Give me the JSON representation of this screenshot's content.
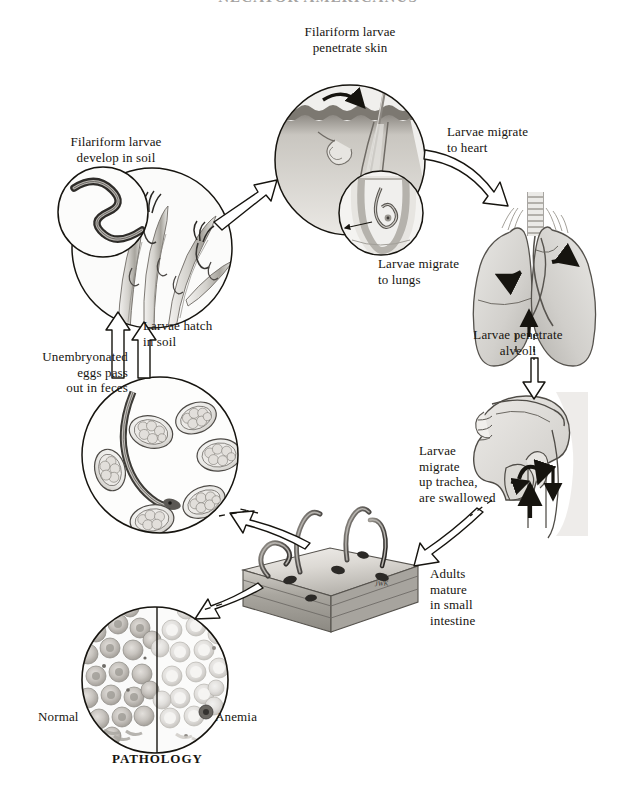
{
  "title": "NECATOR AMERICANUS",
  "figure": {
    "kind": "life-cycle-diagram",
    "background_color": "#ffffff",
    "ink_color": "#16140f",
    "signature": "JWK"
  },
  "stages": [
    {
      "id": "penetrate-skin",
      "label": "Filariform larvae\npenetrate skin",
      "art": "skin-section-with-hair-follicle-and-larva"
    },
    {
      "id": "develop-in-soil",
      "label": "Filariform larvae\ndevelop in soil",
      "art": "coiled-filariform-larva-inset"
    },
    {
      "id": "hatch-in-soil",
      "label": "Larvae hatch\nin soil",
      "art": "grass-blades-with-larvae"
    },
    {
      "id": "eggs-in-feces",
      "label": "Unembryonated\neggs pass\nout in feces",
      "art": "fecal-smear-with-eggs-and-larva"
    },
    {
      "id": "migrate-to-heart",
      "label": "Larvae migrate\nto heart",
      "art": "arrow-only"
    },
    {
      "id": "migrate-to-lungs",
      "label": "Larvae migrate\nto lungs",
      "art": "lungs-with-trachea"
    },
    {
      "id": "penetrate-alveoli",
      "label": "Larvae penetrate\nalveoli",
      "art": "upward-arrow-into-lungs"
    },
    {
      "id": "migrate-up-trachea",
      "label": "Larvae\nmigrate\nup trachea,\nare swallowed",
      "art": "head-sagittal-section-pharynx"
    },
    {
      "id": "adults-in-intestine",
      "label": "Adults\nmature\nin small\nintestine",
      "art": "intestinal-wall-block-with-adult-worms"
    }
  ],
  "pathology": {
    "caption": "PATHOLOGY",
    "left_label": "Normal",
    "right_label": "Anemia",
    "art": "split-blood-smear-circle"
  },
  "arrows": [
    {
      "id": "soil-to-skin",
      "style": "outline",
      "from": "develop-in-soil",
      "to": "penetrate-skin"
    },
    {
      "id": "skin-to-heart",
      "style": "outline",
      "from": "penetrate-skin",
      "to": "migrate-to-lungs"
    },
    {
      "id": "lungs-to-head",
      "style": "outline-dashed-tail",
      "from": "migrate-to-lungs",
      "to": "migrate-up-trachea"
    },
    {
      "id": "head-to-intestine",
      "style": "outline-dashed-tail",
      "from": "migrate-up-trachea",
      "to": "adults-in-intestine"
    },
    {
      "id": "intestine-to-feces",
      "style": "outline-dashed-tail",
      "from": "adults-in-intestine",
      "to": "eggs-in-feces"
    },
    {
      "id": "intestine-to-blood",
      "style": "outline-dashed-tail",
      "from": "adults-in-intestine",
      "to": "pathology"
    },
    {
      "id": "feces-to-soil",
      "style": "outline",
      "from": "eggs-in-feces",
      "to": "hatch-in-soil"
    },
    {
      "id": "alveoli-pointer",
      "style": "solid-small",
      "from": "penetrate-alveoli",
      "to": "migrate-to-lungs"
    }
  ]
}
